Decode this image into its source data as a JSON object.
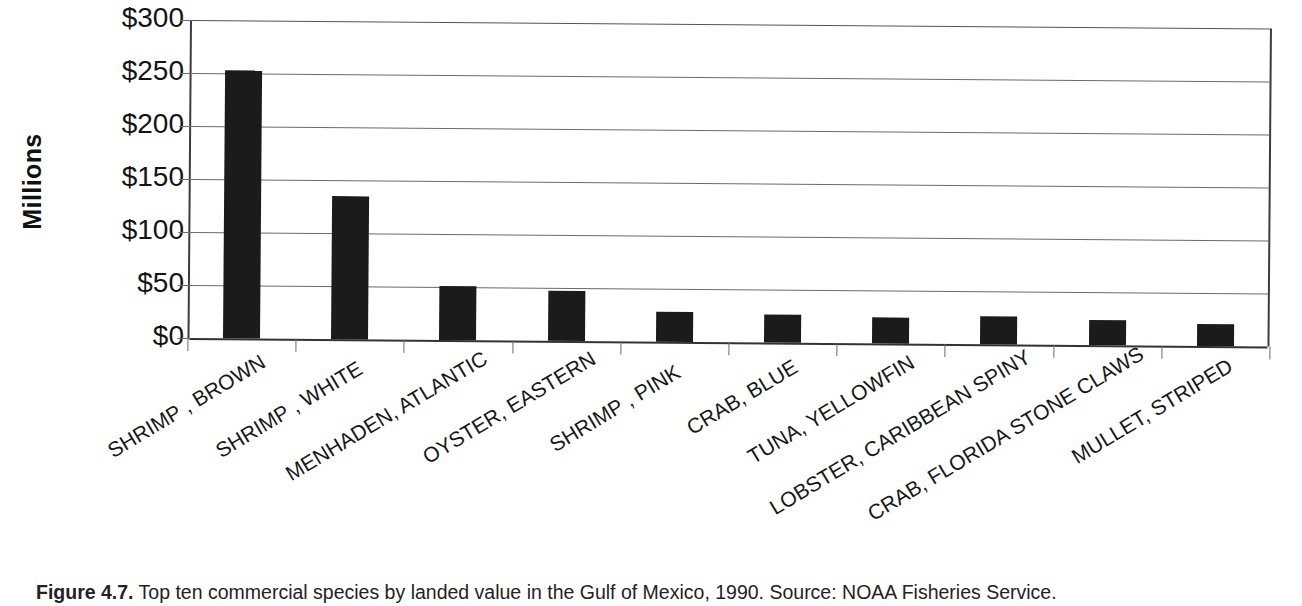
{
  "chart_data": {
    "type": "bar",
    "title": "",
    "xlabel": "",
    "ylabel": "Millions",
    "ylim": [
      0,
      300
    ],
    "ytick_values": [
      0,
      50,
      100,
      150,
      200,
      250,
      300
    ],
    "ytick_labels": [
      "$0",
      "$50",
      "$100",
      "$150",
      "$200",
      "$250",
      "$300"
    ],
    "grid": true,
    "legend": "none",
    "orientation": "vertical",
    "bar_color": "#1b1b1b",
    "categories": [
      "SHRIMP , BROWN",
      "SHRIMP , WHITE",
      "MENHADEN, ATLANTIC",
      "OYSTER, EASTERN",
      "SHRIMP , PINK",
      "CRAB, BLUE",
      "TUNA, YELLOWFIN",
      "LOBSTER, CARIBBEAN SPINY",
      "CRAB, FLORIDA STONE CLAWS",
      "MULLET, STRIPED"
    ],
    "values": [
      253,
      135,
      51,
      47,
      28,
      26,
      25,
      26,
      24,
      21
    ],
    "units": "Millions of dollars"
  },
  "caption": {
    "label": "Figure 4.7.",
    "text": " Top ten commercial species by landed value in the Gulf of Mexico, 1990. Source: NOAA Fisheries Service."
  }
}
